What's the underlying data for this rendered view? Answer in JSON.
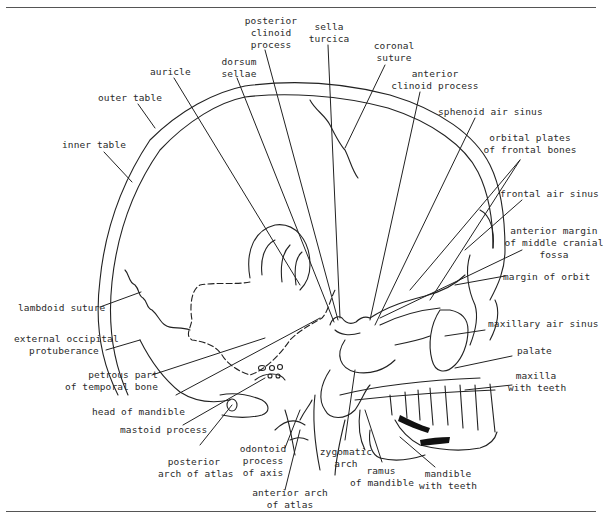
{
  "figure": {
    "colors": {
      "line": "#222222",
      "background": "#ffffff",
      "rule": "#555555"
    }
  },
  "labels": {
    "posterior_clinoid_process": "posterior\nclinoid\nprocess",
    "sella_turcica": "sella\nturcica",
    "coronal_suture": "coronal\nsuture",
    "dorsum_sellae": "dorsum\nsellae",
    "anterior_clinoid_process": "anterior\nclinoid process",
    "auricle": "auricle",
    "outer_table": "outer table",
    "sphenoid_air_sinus": "sphenoid air sinus",
    "orbital_plates": "orbital plates\nof frontal bones",
    "inner_table": "inner table",
    "frontal_air_sinus": "frontal air sinus",
    "anterior_margin": "anterior margin\nof middle cranial\nfossa",
    "margin_of_orbit": "margin of orbit",
    "lambdoid_suture": "lambdoid suture",
    "maxillary_air_sinus": "maxillary air sinus",
    "external_occipital_protuberance": "external occipital\nprotuberance",
    "palate": "palate",
    "petrous_part": "petrous part\nof temporal bone",
    "maxilla_with_teeth": "maxilla\nwith teeth",
    "head_of_mandible": "head of mandible",
    "mastoid_process": "mastoid process",
    "zygomatic_arch": "zygomatic\narch",
    "posterior_arch_of_atlas": "posterior\narch of atlas",
    "odontoid_process": "odontoid\nprocess\nof axis",
    "ramus_of_mandible": "ramus\nof mandible",
    "mandible_with_teeth": "mandible\nwith teeth",
    "anterior_arch_of_atlas": "anterior arch\nof atlas"
  }
}
